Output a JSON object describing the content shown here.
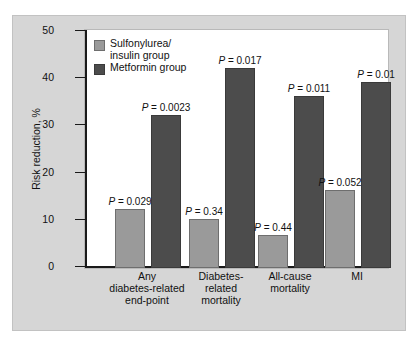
{
  "chart_data": {
    "type": "bar",
    "title": "",
    "xlabel": "",
    "ylabel": "Risk reduction, %",
    "ylim": [
      0,
      50
    ],
    "yticks": [
      0,
      10,
      20,
      30,
      40,
      50
    ],
    "grid": false,
    "legend_position": "top-left",
    "categories": [
      "Any\ndiabetes-related\nend-point",
      "Diabetes-\nrelated\nmortality",
      "All-cause\nmortality",
      "MI"
    ],
    "series": [
      {
        "name": "Sulfonylurea/\ninsulin group",
        "color": "#9a9a9a",
        "values": [
          12,
          10,
          6.5,
          16
        ],
        "annotations": [
          "P = 0.029",
          "P = 0.34",
          "P = 0.44",
          "P = 0.052"
        ]
      },
      {
        "name": "Metformin group",
        "color": "#4c4c4c",
        "values": [
          32,
          42,
          36,
          39
        ],
        "annotations": [
          "P = 0.0023",
          "P = 0.017",
          "P = 0.011",
          "P = 0.01"
        ]
      }
    ]
  },
  "legend": {
    "items": [
      {
        "label": "Sulfonylurea/\ninsulin group",
        "swatch": "light"
      },
      {
        "label": "Metformin group",
        "swatch": "dark"
      }
    ]
  },
  "axis": {
    "y_title": "Risk reduction, %",
    "y_tick_labels": [
      "0",
      "10",
      "20",
      "30",
      "40",
      "50"
    ]
  },
  "pvalues": {
    "light": [
      "P = 0.029",
      "P = 0.34",
      "P = 0.44",
      "P = 0.052"
    ],
    "dark": [
      "P = 0.0023",
      "P = 0.017",
      "P = 0.011",
      "P = 0.01"
    ]
  }
}
